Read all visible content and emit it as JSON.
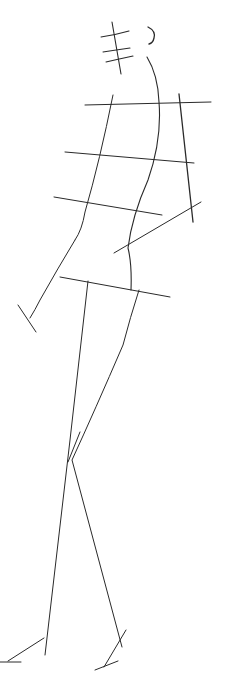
{
  "canvas": {
    "width": 227,
    "height": 695,
    "background": "#ffffff",
    "ink": "#2a2a2a"
  },
  "figure": {
    "strokes": [
      {
        "name": "head-center-line",
        "d": "M112 22 L121 74",
        "w": 1.1
      },
      {
        "name": "head-guide-1",
        "d": "M101 37 Q115 35 129 31",
        "w": 1.1
      },
      {
        "name": "head-guide-2",
        "d": "M103 52 Q116 50 130 48",
        "w": 1.1
      },
      {
        "name": "head-guide-3",
        "d": "M106 62 Q119 59 133 56",
        "w": 1.1
      },
      {
        "name": "ear-curve",
        "d": "M148 27 Q156 31 154 38 Q153 43 149 44",
        "w": 1.3
      },
      {
        "name": "spine-curve",
        "d": "M147 57 Q158 75 159 102 Q162 140 148 180 Q132 216 128 248 Q132 264 131 290",
        "w": 1.1
      },
      {
        "name": "shoulder-line",
        "d": "M85 105 L211 102",
        "w": 1.0
      },
      {
        "name": "chest-line",
        "d": "M65 152 L194 163",
        "w": 1.0
      },
      {
        "name": "waist-line",
        "d": "M54 197 L162 215",
        "w": 1.0
      },
      {
        "name": "hip-line",
        "d": "M60 277 L170 297",
        "w": 1.0
      },
      {
        "name": "torso-left-edge",
        "d": "M113 95 Q100 160 85 212 Q82 230 75 240",
        "w": 1.0
      },
      {
        "name": "upper-arm-left",
        "d": "M75 240 Q58 268 40 300 Q35 310 30 318",
        "w": 1.0
      },
      {
        "name": "hand-left-mark",
        "d": "M18 305 L36 332",
        "w": 1.0
      },
      {
        "name": "back-arm-line",
        "d": "M179 94 L193 222",
        "w": 1.3
      },
      {
        "name": "forearm-right",
        "d": "M114 253 L201 202",
        "w": 1.0
      },
      {
        "name": "leg-left-thigh",
        "d": "M88 281 L70 440 L45 655",
        "w": 1.0
      },
      {
        "name": "leg-right",
        "d": "M139 290 Q130 318 123 345 Q95 410 72 460 L122 647",
        "w": 1.0
      },
      {
        "name": "knee-mark",
        "d": "M68 462 L80 432",
        "w": 1.0
      },
      {
        "name": "foot-left",
        "d": "M8 661 L44 638",
        "w": 1.0
      },
      {
        "name": "foot-left-sole",
        "d": "M0 662 L21 662",
        "w": 1.0
      },
      {
        "name": "foot-right",
        "d": "M104 667 L126 630",
        "w": 1.0
      },
      {
        "name": "foot-right-sole",
        "d": "M95 670 L118 661",
        "w": 1.0
      }
    ]
  }
}
